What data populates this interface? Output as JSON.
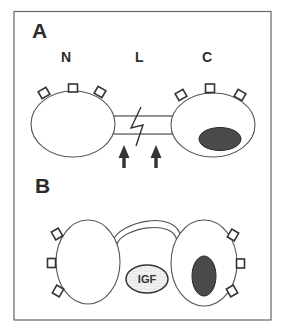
{
  "figure": {
    "frame_color": "#666666",
    "panels": [
      {
        "id": "A",
        "letter": "A",
        "labels": {
          "left_cell": "N",
          "junction": "L",
          "right_cell": "C"
        },
        "description": "Two horizontally elongated cells joined by a tubular bridge with a lightning-bolt break; two upward arrows point at the bridge; right cell contains a dark horizontal nucleus; each cell has three square receptors on top"
      },
      {
        "id": "B",
        "letter": "B",
        "igf_label": "IGF",
        "description": "Two vertically elongated cells connected by an arched bridge above; an IGF-labelled stippled ellipse sits between them; right cell contains a dark vertical nucleus; each cell has three square receptors on its outer side"
      }
    ],
    "colors": {
      "nucleus": "#4a4a4a",
      "igf_fill": "#e6e6e6",
      "stroke": "#555555"
    }
  }
}
